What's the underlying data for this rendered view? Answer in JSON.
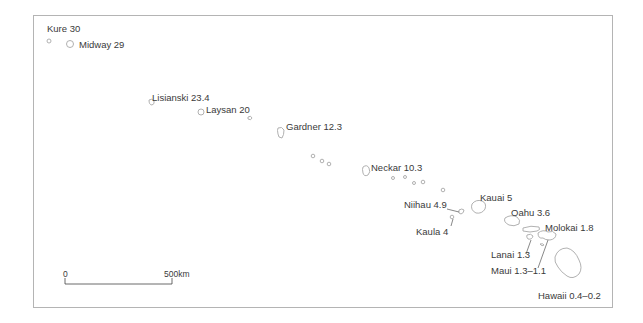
{
  "map": {
    "title": "Hawaiian–Emperor island chain ages (Ma)",
    "islands": [
      {
        "name": "Kure",
        "age": "30",
        "label": "Kure 30"
      },
      {
        "name": "Midway",
        "age": "29",
        "label": "Midway 29"
      },
      {
        "name": "Lisianski",
        "age": "23.4",
        "label": "Lisianski 23.4"
      },
      {
        "name": "Laysan",
        "age": "20",
        "label": "Laysan 20"
      },
      {
        "name": "Gardner",
        "age": "12.3",
        "label": "Gardner 12.3"
      },
      {
        "name": "Neckar",
        "age": "10.3",
        "label": "Neckar 10.3"
      },
      {
        "name": "Kauai",
        "age": "5",
        "label": "Kauai 5"
      },
      {
        "name": "Niihau",
        "age": "4.9",
        "label": "Niihau 4.9"
      },
      {
        "name": "Kaula",
        "age": "4",
        "label": "Kaula 4"
      },
      {
        "name": "Oahu",
        "age": "3.6",
        "label": "Oahu 3.6"
      },
      {
        "name": "Molokai",
        "age": "1.8",
        "label": "Molokai 1.8"
      },
      {
        "name": "Lanai",
        "age": "1.3",
        "label": "Lanai 1.3"
      },
      {
        "name": "Maui",
        "age": "1.3–1.1",
        "label": "Maui 1.3–1.1"
      },
      {
        "name": "Hawaii",
        "age": "0.4–0.2",
        "label": "Hawaii 0.4–0.2"
      }
    ],
    "scale_bar": {
      "start": "0",
      "end": "500 km",
      "end_label": "500km"
    },
    "colors": {
      "outline": "#a8a8a8",
      "text": "#3a3a3a",
      "frame": "#b4b4b4"
    }
  }
}
